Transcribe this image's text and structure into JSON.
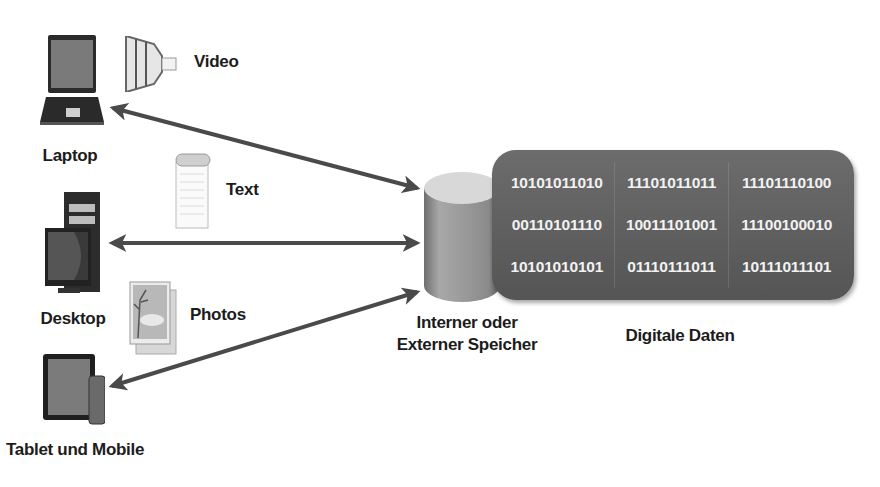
{
  "diagram": {
    "devices": [
      {
        "id": "laptop",
        "label": "Laptop"
      },
      {
        "id": "desktop",
        "label": "Desktop"
      },
      {
        "id": "tablet",
        "label": "Tablet und Mobile"
      }
    ],
    "media": [
      {
        "id": "video",
        "label": "Video",
        "icon": "film-strip-icon"
      },
      {
        "id": "text",
        "label": "Text",
        "icon": "notepad-icon"
      },
      {
        "id": "photos",
        "label": "Photos",
        "icon": "photo-icon"
      }
    ],
    "storage": {
      "label_line1": "Interner oder",
      "label_line2": "Externer Speicher",
      "icon": "database-cylinder-icon"
    },
    "digital_data": {
      "label": "Digitale Daten",
      "rows": [
        [
          "10101011010",
          "11101011011",
          "11101110100"
        ],
        [
          "00110101110",
          "10011101001",
          "11100100010"
        ],
        [
          "10101010101",
          "01110111011",
          "10111011101"
        ]
      ]
    },
    "connections": [
      {
        "from": "storage",
        "to": "laptop",
        "type": "bidirectional"
      },
      {
        "from": "storage",
        "to": "desktop",
        "type": "bidirectional"
      },
      {
        "from": "storage",
        "to": "tablet",
        "type": "bidirectional"
      }
    ],
    "colors": {
      "arrow": "#4a4a4a",
      "data_box": "#616161",
      "data_text": "#f2f2f2",
      "cylinder_top": "#d8d8d8",
      "cylinder_body": "#9a9a9a"
    }
  }
}
